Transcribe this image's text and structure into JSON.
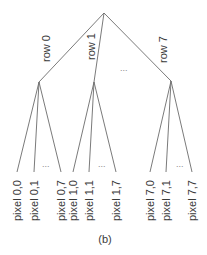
{
  "diagram": {
    "type": "tree",
    "caption": "(b)",
    "ellipsis": "...",
    "root": {
      "x": 104,
      "y": 13
    },
    "branches": [
      {
        "label": "row 0",
        "node": {
          "x": 39,
          "y": 82
        },
        "label_pos": {
          "x": 49,
          "y": 50
        },
        "leaves": [
          {
            "label": "pixel 0,0",
            "x": 17
          },
          {
            "label": "pixel 0,1",
            "x": 34
          },
          {
            "label": "pixel 0,7",
            "x": 61
          }
        ],
        "dots_pos": {
          "x": 48,
          "y": 166
        }
      },
      {
        "label": "row 1",
        "node": {
          "x": 94,
          "y": 82
        },
        "label_pos": {
          "x": 93,
          "y": 49
        },
        "leaves": [
          {
            "label": "pixel 1,0",
            "x": 73
          },
          {
            "label": "pixel 1,1",
            "x": 89
          },
          {
            "label": "pixel 1,7",
            "x": 116
          }
        ],
        "dots_pos": {
          "x": 104,
          "y": 166
        }
      },
      {
        "label": "row 7",
        "node": {
          "x": 171,
          "y": 81
        },
        "label_pos": {
          "x": 165,
          "y": 51
        },
        "leaves": [
          {
            "label": "pixel 7,0",
            "x": 150
          },
          {
            "label": "pixel 7,1",
            "x": 166
          },
          {
            "label": "pixel 7,7",
            "x": 192
          }
        ],
        "dots_pos": {
          "x": 181,
          "y": 166
        }
      }
    ],
    "middle_dots_pos": {
      "x": 126,
      "y": 70
    },
    "leaf_y": 172
  },
  "labels": {
    "row_0": "row 0",
    "row_1": "row 1",
    "row_7": "row 7",
    "pixel_0_0": "pixel 0,0",
    "pixel_0_1": "pixel 0,1",
    "pixel_0_7": "pixel 0,7",
    "pixel_1_0": "pixel 1,0",
    "pixel_1_1": "pixel 1,1",
    "pixel_1_7": "pixel 1,7",
    "pixel_7_0": "pixel 7,0",
    "pixel_7_1": "pixel 7,1",
    "pixel_7_7": "pixel 7,7",
    "ellipsis": "...",
    "caption": "(b)"
  }
}
